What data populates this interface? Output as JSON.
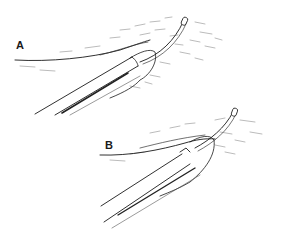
{
  "figure": {
    "type": "surgical line illustration",
    "panels": [
      {
        "label": "A",
        "description": "forceps grasping tissue edge with thread/catheter exiting tissue"
      },
      {
        "label": "B",
        "description": "forceps grasping tissue with thread pulled through and tissue everted"
      }
    ]
  },
  "colors": {
    "ink": "#1a1a1a",
    "hatch": "#555555",
    "background": "#ffffff"
  }
}
